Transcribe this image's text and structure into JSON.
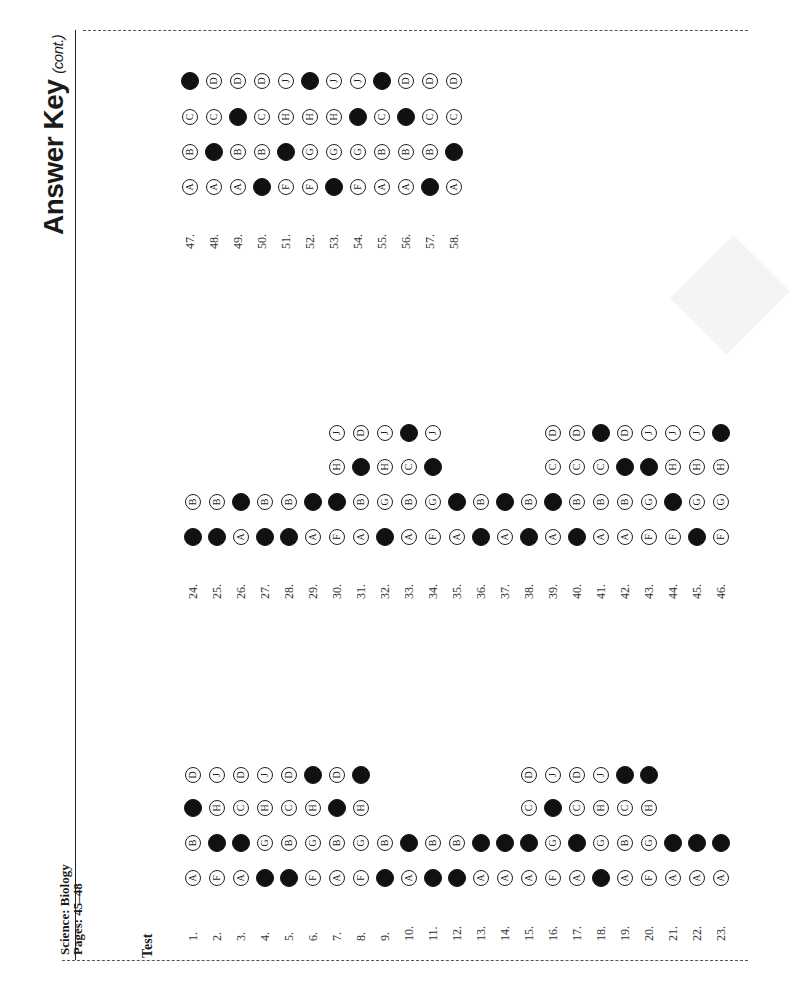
{
  "header": {
    "title": "Answer Key",
    "title_suffix": "(cont.)",
    "subject": "Science: Biology",
    "pages": "Pages: 45–48",
    "section": "Test"
  },
  "blocks": [
    {
      "num_y": 930,
      "row_y": [
        878,
        843,
        808,
        775
      ],
      "start_x": 183,
      "spacing": 24,
      "questions": [
        {
          "n": "1.",
          "options": [
            "A",
            "B",
            "C",
            "D"
          ],
          "answer": "C"
        },
        {
          "n": "2.",
          "options": [
            "F",
            "G",
            "H",
            "J"
          ],
          "answer": "G"
        },
        {
          "n": "3.",
          "options": [
            "A",
            "B",
            "C",
            "D"
          ],
          "answer": "B"
        },
        {
          "n": "4.",
          "options": [
            "F",
            "G",
            "H",
            "J"
          ],
          "answer": "F"
        },
        {
          "n": "5.",
          "options": [
            "A",
            "B",
            "C",
            "D"
          ],
          "answer": "A"
        },
        {
          "n": "6.",
          "options": [
            "F",
            "G",
            "H",
            "J"
          ],
          "answer": "J"
        },
        {
          "n": "7.",
          "options": [
            "A",
            "B",
            "C",
            "D"
          ],
          "answer": "C"
        },
        {
          "n": "8.",
          "options": [
            "F",
            "G",
            "H",
            "J"
          ],
          "answer": "J"
        },
        {
          "n": "9.",
          "options": [
            "A",
            "B"
          ],
          "answer": "A"
        },
        {
          "n": "10.",
          "options": [
            "A",
            "B"
          ],
          "answer": "B"
        },
        {
          "n": "11.",
          "options": [
            "A",
            "B"
          ],
          "answer": "A"
        },
        {
          "n": "12.",
          "options": [
            "A",
            "B"
          ],
          "answer": "A"
        },
        {
          "n": "13.",
          "options": [
            "A",
            "B"
          ],
          "answer": "B"
        },
        {
          "n": "14.",
          "options": [
            "A",
            "B"
          ],
          "answer": "B"
        },
        {
          "n": "15.",
          "options": [
            "A",
            "B",
            "C",
            "D"
          ],
          "answer": "B"
        },
        {
          "n": "16.",
          "options": [
            "F",
            "G",
            "H",
            "J"
          ],
          "answer": "H"
        },
        {
          "n": "17.",
          "options": [
            "A",
            "B",
            "C",
            "D"
          ],
          "answer": "B"
        },
        {
          "n": "18.",
          "options": [
            "F",
            "G",
            "H",
            "J"
          ],
          "answer": "F"
        },
        {
          "n": "19.",
          "options": [
            "A",
            "B",
            "C",
            "D"
          ],
          "answer": "D"
        },
        {
          "n": "20.",
          "options": [
            "F",
            "G",
            "H",
            "J"
          ],
          "answer": "J"
        },
        {
          "n": "21.",
          "options": [
            "A",
            "B"
          ],
          "answer": "B"
        },
        {
          "n": "22.",
          "options": [
            "A",
            "B"
          ],
          "answer": "B"
        },
        {
          "n": "23.",
          "options": [
            "A",
            "B"
          ],
          "answer": "B"
        }
      ]
    },
    {
      "num_y": 588,
      "row_y": [
        537,
        502,
        467,
        433
      ],
      "start_x": 183,
      "spacing": 24,
      "questions": [
        {
          "n": "24.",
          "options": [
            "A",
            "B"
          ],
          "answer": "A"
        },
        {
          "n": "25.",
          "options": [
            "A",
            "B"
          ],
          "answer": "A"
        },
        {
          "n": "26.",
          "options": [
            "A",
            "B"
          ],
          "answer": "B"
        },
        {
          "n": "27.",
          "options": [
            "A",
            "B"
          ],
          "answer": "A"
        },
        {
          "n": "28.",
          "options": [
            "A",
            "B"
          ],
          "answer": "A"
        },
        {
          "n": "29.",
          "options": [
            "A",
            "B"
          ],
          "answer": "B"
        },
        {
          "n": "30.",
          "options": [
            "F",
            "G",
            "H",
            "J"
          ],
          "answer": "G"
        },
        {
          "n": "31.",
          "options": [
            "A",
            "B",
            "C",
            "D"
          ],
          "answer": "C"
        },
        {
          "n": "32.",
          "options": [
            "F",
            "G",
            "H",
            "J"
          ],
          "answer": "F"
        },
        {
          "n": "33.",
          "options": [
            "A",
            "B",
            "C",
            "D"
          ],
          "answer": "D"
        },
        {
          "n": "34.",
          "options": [
            "F",
            "G",
            "H",
            "J"
          ],
          "answer": "H"
        },
        {
          "n": "35.",
          "options": [
            "A",
            "B"
          ],
          "answer": "B"
        },
        {
          "n": "36.",
          "options": [
            "A",
            "B"
          ],
          "answer": "A"
        },
        {
          "n": "37.",
          "options": [
            "A",
            "B"
          ],
          "answer": "B"
        },
        {
          "n": "38.",
          "options": [
            "A",
            "B"
          ],
          "answer": "A"
        },
        {
          "n": "39.",
          "options": [
            "A",
            "B",
            "C",
            "D"
          ],
          "answer": "B"
        },
        {
          "n": "40.",
          "options": [
            "A",
            "B",
            "C",
            "D"
          ],
          "answer": "A"
        },
        {
          "n": "41.",
          "options": [
            "A",
            "B",
            "C",
            "D"
          ],
          "answer": "D"
        },
        {
          "n": "42.",
          "options": [
            "A",
            "B",
            "C",
            "D"
          ],
          "answer": "C"
        },
        {
          "n": "43.",
          "options": [
            "F",
            "G",
            "H",
            "J"
          ],
          "answer": "H"
        },
        {
          "n": "44.",
          "options": [
            "F",
            "G",
            "H",
            "J"
          ],
          "answer": "G"
        },
        {
          "n": "45.",
          "options": [
            "F",
            "G",
            "H",
            "J"
          ],
          "answer": "F"
        },
        {
          "n": "46.",
          "options": [
            "F",
            "G",
            "H",
            "J"
          ],
          "answer": "J"
        }
      ]
    },
    {
      "num_y": 238,
      "row_y": [
        187,
        152,
        117,
        81
      ],
      "start_x": 180,
      "spacing": 24,
      "questions": [
        {
          "n": "47.",
          "options": [
            "A",
            "B",
            "C",
            "D"
          ],
          "answer": "D"
        },
        {
          "n": "48.",
          "options": [
            "A",
            "B",
            "C",
            "D"
          ],
          "answer": "B"
        },
        {
          "n": "49.",
          "options": [
            "A",
            "B",
            "C",
            "D"
          ],
          "answer": "C"
        },
        {
          "n": "50.",
          "options": [
            "A",
            "B",
            "C",
            "D"
          ],
          "answer": "A"
        },
        {
          "n": "51.",
          "options": [
            "F",
            "G",
            "H",
            "J"
          ],
          "answer": "G"
        },
        {
          "n": "52.",
          "options": [
            "F",
            "G",
            "H",
            "J"
          ],
          "answer": "J"
        },
        {
          "n": "53.",
          "options": [
            "F",
            "G",
            "H",
            "J"
          ],
          "answer": "F"
        },
        {
          "n": "54.",
          "options": [
            "F",
            "G",
            "H",
            "J"
          ],
          "answer": "H"
        },
        {
          "n": "55.",
          "options": [
            "A",
            "B",
            "C",
            "D"
          ],
          "answer": "D"
        },
        {
          "n": "56.",
          "options": [
            "A",
            "B",
            "C",
            "D"
          ],
          "answer": "C"
        },
        {
          "n": "57.",
          "options": [
            "A",
            "B",
            "C",
            "D"
          ],
          "answer": "A"
        },
        {
          "n": "58.",
          "options": [
            "A",
            "B",
            "C",
            "D"
          ],
          "answer": "B"
        }
      ]
    }
  ]
}
